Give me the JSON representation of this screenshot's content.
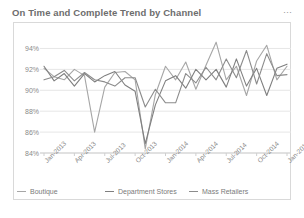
{
  "header": {
    "title": "On Time and Complete Trend by Channel",
    "menu_icon": "ellipsis-icon",
    "menu_glyph": "⋯"
  },
  "chart_data": {
    "type": "line",
    "title": "On Time and Complete Trend by Channel",
    "xlabel": "",
    "ylabel": "",
    "ylim": [
      84,
      95
    ],
    "yticks": [
      84,
      86,
      88,
      90,
      92,
      94
    ],
    "ytick_labels": [
      "84%",
      "86%",
      "88%",
      "90%",
      "92%",
      "94%"
    ],
    "grid": true,
    "legend_position": "bottom",
    "x": [
      "Jan-2013",
      "Feb-2013",
      "Mar-2013",
      "Apr-2013",
      "May-2013",
      "Jun-2013",
      "Jul-2013",
      "Aug-2013",
      "Sep-2013",
      "Oct-2013",
      "Nov-2013",
      "Dec-2013",
      "Jan-2014",
      "Feb-2014",
      "Mar-2014",
      "Apr-2014",
      "May-2014",
      "Jun-2014",
      "Jul-2014",
      "Aug-2014",
      "Sep-2014",
      "Oct-2014",
      "Nov-2014",
      "Dec-2014",
      "Jan-2015"
    ],
    "xtick_labels": [
      "Jan-2013",
      "Apr-2013",
      "Jul-2013",
      "Oct-2013",
      "Jan-2014",
      "Apr-2014",
      "Jul-2014",
      "Oct-2014",
      "Jan-2015"
    ],
    "xtick_indices": [
      0,
      3,
      6,
      9,
      12,
      15,
      18,
      21,
      24
    ],
    "series": [
      {
        "name": "Boutique",
        "color": "#a6a6a6",
        "values": [
          92.1,
          91.3,
          91.0,
          92.0,
          91.4,
          86.0,
          90.3,
          91.7,
          91.8,
          91.0,
          84.4,
          89.6,
          92.3,
          91.0,
          92.7,
          90.1,
          92.4,
          94.6,
          91.0,
          92.3,
          89.5,
          92.8,
          94.3,
          91.0,
          92.3
        ]
      },
      {
        "name": "Department Stores",
        "color": "#7f7f7f",
        "values": [
          92.3,
          90.9,
          91.6,
          90.4,
          91.6,
          90.8,
          91.4,
          91.8,
          90.5,
          89.9,
          84.9,
          88.6,
          90.9,
          91.4,
          90.2,
          92.0,
          91.0,
          92.0,
          90.3,
          93.0,
          90.4,
          92.1,
          89.5,
          92.1,
          92.5
        ]
      },
      {
        "name": "Mass Retailers",
        "color": "#8c8c8c",
        "values": [
          91.0,
          91.3,
          91.9,
          90.9,
          91.7,
          91.0,
          90.8,
          90.4,
          91.2,
          91.2,
          88.4,
          90.1,
          88.8,
          88.8,
          91.6,
          90.7,
          92.2,
          91.0,
          93.0,
          91.2,
          93.8,
          90.6,
          93.5,
          91.4,
          91.5
        ]
      }
    ]
  }
}
